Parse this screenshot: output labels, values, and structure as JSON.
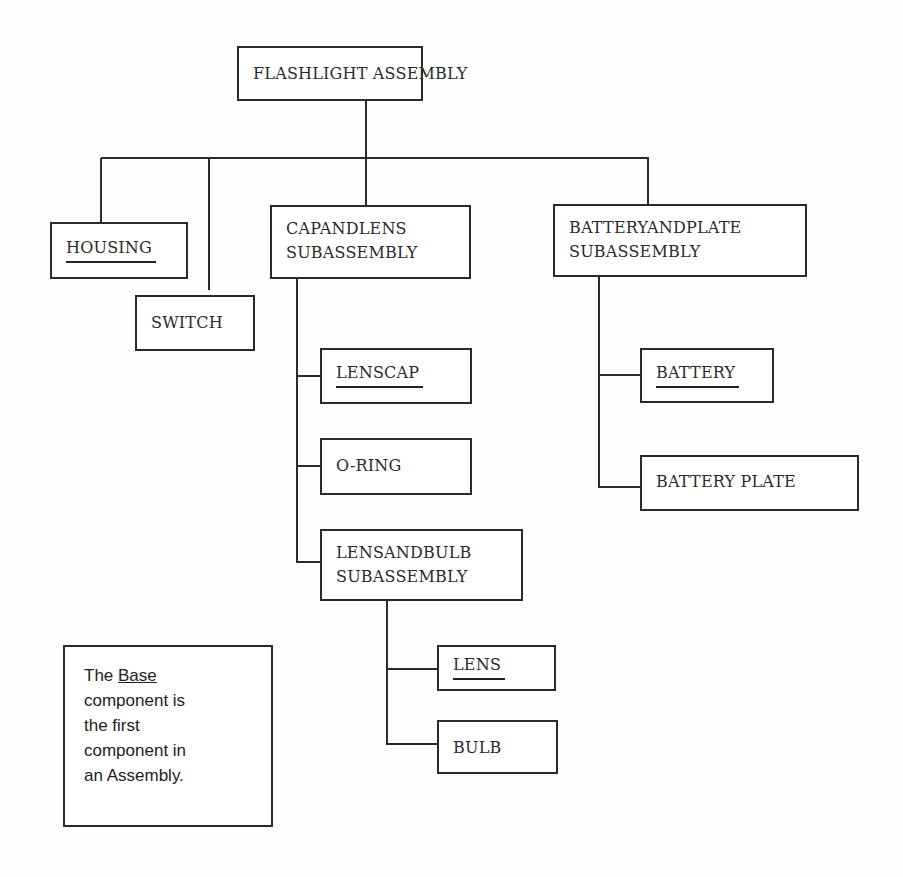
{
  "diagram": {
    "type": "tree",
    "title": "FLASHLIGHT ASSEMBLY",
    "root": {
      "label": "FLASHLIGHT ASSEMBLY",
      "children": [
        {
          "label": "HOUSING",
          "underlined": true
        },
        {
          "label": "SWITCH",
          "underlined": false
        },
        {
          "label_lines": [
            "CAPANDLENS",
            "SUBASSEMBLY"
          ],
          "children": [
            {
              "label": "LENSCAP",
              "underlined": true
            },
            {
              "label": "O-RING",
              "underlined": false
            },
            {
              "label_lines": [
                "LENSANDBULB",
                "SUBASSEMBLY"
              ],
              "children": [
                {
                  "label": "LENS",
                  "underlined": true
                },
                {
                  "label": "BULB",
                  "underlined": false
                }
              ]
            }
          ]
        },
        {
          "label_lines": [
            "BATTERYANDPLATE",
            "SUBASSEMBLY"
          ],
          "children": [
            {
              "label": "BATTERY",
              "underlined": true
            },
            {
              "label": "BATTERY PLATE",
              "underlined": false
            }
          ]
        }
      ]
    }
  },
  "nodes": {
    "root": "FLASHLIGHT ASSEMBLY",
    "housing": "HOUSING",
    "switch": "SWITCH",
    "cap_lens": {
      "line1": "CAPANDLENS",
      "line2": "SUBASSEMBLY"
    },
    "battery_plate_sub": {
      "line1": "BATTERYANDPLATE",
      "line2": "SUBASSEMBLY"
    },
    "lenscap": "LENSCAP",
    "oring": "O-RING",
    "lens_bulb": {
      "line1": "LENSANDBULB",
      "line2": "SUBASSEMBLY"
    },
    "lens": "LENS",
    "bulb": "BULB",
    "battery": "BATTERY",
    "battery_plate": "BATTERY PLATE"
  },
  "note": {
    "prefix": "The ",
    "emphasis": "Base",
    "line1_suffix": "",
    "line2": "component is",
    "line3": "the first",
    "line4": "component in",
    "line5": "an Assembly."
  },
  "colors": {
    "line": "#2a2a2a",
    "text": "#2b2b2b",
    "background": "#fdfdfd"
  }
}
